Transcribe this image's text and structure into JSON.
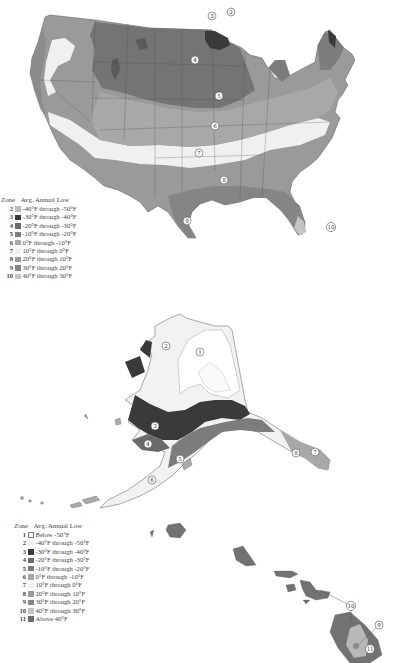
{
  "maps": {
    "continental_us": {
      "zone_labels": [
        {
          "zone": "2",
          "x": 231,
          "y": 12
        },
        {
          "zone": "3",
          "x": 212,
          "y": 16
        },
        {
          "zone": "4",
          "x": 195,
          "y": 60
        },
        {
          "zone": "5",
          "x": 219,
          "y": 96
        },
        {
          "zone": "6",
          "x": 215,
          "y": 126
        },
        {
          "zone": "7",
          "x": 199,
          "y": 153
        },
        {
          "zone": "8",
          "x": 224,
          "y": 180
        },
        {
          "zone": "9",
          "x": 187,
          "y": 221
        },
        {
          "zone": "10",
          "x": 331,
          "y": 227
        }
      ],
      "legend": {
        "header_zone": "Zone",
        "header_temp": "Avg. Annual Low",
        "rows": [
          {
            "zone": "2",
            "range": "-40°F through -50°F",
            "color": "#bdbdbd"
          },
          {
            "zone": "3",
            "range": "-30°F through -40°F",
            "color": "#3a3a3a"
          },
          {
            "zone": "4",
            "range": "-20°F through -30°F",
            "color": "#6a6a6a"
          },
          {
            "zone": "5",
            "range": "-10°F through -20°F",
            "color": "#7c7c7c"
          },
          {
            "zone": "6",
            "range": "0°F through -10°F",
            "color": "#a8a8a8"
          },
          {
            "zone": "7",
            "range": "10°F through 0°F",
            "color": "#f1f1f1"
          },
          {
            "zone": "8",
            "range": "20°F through 10°F",
            "color": "#9a9a9a"
          },
          {
            "zone": "9",
            "range": "30°F through 20°F",
            "color": "#858585"
          },
          {
            "zone": "10",
            "range": "40°F through 30°F",
            "color": "#c4c4c4"
          }
        ]
      }
    },
    "alaska_hawaii": {
      "zone_labels": [
        {
          "zone": "1",
          "x": 200,
          "y": 352
        },
        {
          "zone": "2",
          "x": 166,
          "y": 346
        },
        {
          "zone": "3",
          "x": 155,
          "y": 426
        },
        {
          "zone": "4",
          "x": 148,
          "y": 444
        },
        {
          "zone": "5",
          "x": 180,
          "y": 459
        },
        {
          "zone": "6",
          "x": 152,
          "y": 480
        },
        {
          "zone": "8",
          "x": 296,
          "y": 453
        },
        {
          "zone": "7",
          "x": 315,
          "y": 452
        },
        {
          "zone": "10",
          "x": 351,
          "y": 606
        },
        {
          "zone": "9",
          "x": 379,
          "y": 625
        },
        {
          "zone": "11",
          "x": 370,
          "y": 649
        }
      ],
      "legend": {
        "header_zone": "Zone",
        "header_temp": "Avg. Annual Low",
        "rows": [
          {
            "zone": "1",
            "range": "Below -50°F",
            "color": "#ffffff"
          },
          {
            "zone": "2",
            "range": "-40°F through -50°F",
            "color": "#f2f2f2"
          },
          {
            "zone": "3",
            "range": "-30°F through -40°F",
            "color": "#3a3a3a"
          },
          {
            "zone": "4",
            "range": "-20°F through -30°F",
            "color": "#6a6a6a"
          },
          {
            "zone": "5",
            "range": "-10°F through -20°F",
            "color": "#7c7c7c"
          },
          {
            "zone": "6",
            "range": "0°F through -10°F",
            "color": "#a8a8a8"
          },
          {
            "zone": "7",
            "range": "10°F through 0°F",
            "color": "#f1f1f1"
          },
          {
            "zone": "8",
            "range": "20°F through 10°F",
            "color": "#9a9a9a"
          },
          {
            "zone": "9",
            "range": "30°F through 20°F",
            "color": "#858585"
          },
          {
            "zone": "10",
            "range": "40°F through 30°F",
            "color": "#c4c4c4"
          },
          {
            "zone": "11",
            "range": "Above 40°F",
            "color": "#6e6e6e"
          }
        ]
      }
    }
  }
}
